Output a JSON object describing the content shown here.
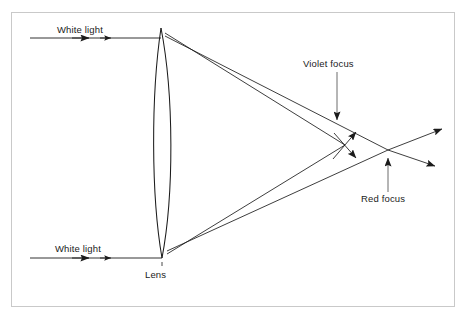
{
  "figure": {
    "background_color": "#ffffff",
    "border_color": "#c9c9c9",
    "line_color": "#1b1b1b"
  },
  "labels": {
    "white_light_top": "White light",
    "white_light_bottom": "White light",
    "lens": "Lens",
    "violet_focus": "Violet focus",
    "red_focus": "Red focus"
  },
  "diagram_data": {
    "type": "ray-diagram",
    "optic": {
      "name": "biconvex-lens",
      "axis_x": 163,
      "top_vertex": [
        161,
        28
      ],
      "bottom_vertex": [
        162,
        258
      ],
      "max_half_width": 11,
      "widest_y": 145
    },
    "incoming_rays": [
      {
        "name": "white-light-top",
        "from": [
          30,
          38
        ],
        "to": [
          161,
          38
        ],
        "color": "white",
        "arrowheads": [
          [
            88,
            38
          ],
          [
            110,
            38
          ]
        ]
      },
      {
        "name": "white-light-bottom",
        "from": [
          30,
          258
        ],
        "to": [
          162,
          258
        ],
        "color": "white",
        "arrowheads": [
          [
            88,
            258
          ],
          [
            110,
            258
          ]
        ]
      }
    ],
    "refracted_rays": [
      {
        "name": "violet-from-top",
        "color": "violet",
        "from": [
          166,
          33
        ],
        "to": [
          345,
          145
        ]
      },
      {
        "name": "red-from-top",
        "color": "red",
        "from": [
          166,
          36
        ],
        "to": [
          388,
          150
        ]
      },
      {
        "name": "violet-from-bottom",
        "color": "violet",
        "from": [
          167,
          254
        ],
        "to": [
          345,
          145
        ]
      },
      {
        "name": "red-from-bottom",
        "color": "red",
        "from": [
          167,
          251
        ],
        "to": [
          388,
          150
        ]
      }
    ],
    "diverging_rays": [
      {
        "name": "violet-past-focus-up",
        "from": [
          345,
          145
        ],
        "to": [
          357,
          131
        ]
      },
      {
        "name": "violet-past-focus-down",
        "from": [
          345,
          145
        ],
        "to": [
          357,
          159
        ]
      },
      {
        "name": "red-past-focus-up",
        "from": [
          388,
          150
        ],
        "to": [
          443,
          129
        ]
      },
      {
        "name": "red-past-focus-down",
        "from": [
          388,
          150
        ],
        "to": [
          436,
          166
        ]
      }
    ],
    "foci": [
      {
        "name": "violet-focus",
        "point": [
          345,
          145
        ],
        "label": "Violet focus",
        "leader_from": [
          337,
          72
        ],
        "leader_to": [
          337,
          120
        ]
      },
      {
        "name": "red-focus",
        "point": [
          388,
          150
        ],
        "label": "Red focus",
        "leader_from": [
          388,
          192
        ],
        "leader_to": [
          388,
          157
        ]
      }
    ]
  }
}
